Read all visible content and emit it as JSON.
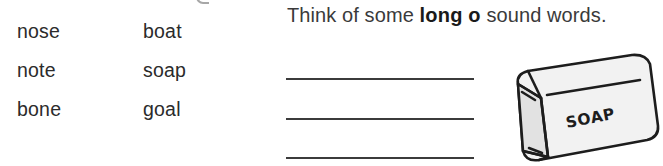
{
  "worksheet": {
    "word_columns": [
      {
        "name": "column-1",
        "words": [
          "nose",
          "note",
          "bone"
        ]
      },
      {
        "name": "column-2",
        "words": [
          "boat",
          "soap",
          "goal"
        ]
      }
    ],
    "instruction": {
      "before": "Think of some ",
      "emphasis": "long o",
      "after": " sound words."
    },
    "answer_lines": [
      "",
      "",
      ""
    ],
    "illustration": {
      "name": "soap-bar",
      "label": "SOAP",
      "outline_color": "#1d1d1d",
      "face_color": "#f2f2f2",
      "side_color": "#e2e2e2"
    },
    "colors": {
      "background": "#ffffff",
      "text": "#2b2b2b",
      "instruction_text": "#3a3a3a",
      "emphasis_text": "#1a1a1a",
      "rule_line": "#3b3b3b"
    }
  }
}
